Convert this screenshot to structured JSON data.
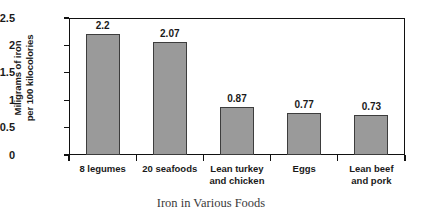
{
  "chart_data": {
    "type": "bar",
    "title": "",
    "xlabel": "Iron in Various Foods",
    "ylabel_line1": "Miligrams of iron",
    "ylabel_line2": "per 100 kilocolories",
    "categories": [
      "8 legumes",
      "20 seafoods",
      "Lean turkey and chicken",
      "Eggs",
      "Lean beef and pork"
    ],
    "category_lines": [
      [
        "8 legumes"
      ],
      [
        "20 seafoods"
      ],
      [
        "Lean turkey",
        "and chicken"
      ],
      [
        "Eggs"
      ],
      [
        "Lean beef",
        "and pork"
      ]
    ],
    "values": [
      2.2,
      2.07,
      0.87,
      0.77,
      0.73
    ],
    "value_labels": [
      "2.2",
      "2.07",
      "0.87",
      "0.77",
      "0.73"
    ],
    "ylim": [
      0,
      2.5
    ],
    "yticks": [
      0,
      0.5,
      1,
      1.5,
      2,
      2.5
    ],
    "ytick_labels": [
      "0",
      "0.5",
      "1",
      "1.5",
      "2",
      "2.5"
    ],
    "grid": false,
    "legend": "none",
    "bar_color": "#9a9a9a",
    "bar_edge_color": "#3d3d3d",
    "axis_color": "#111111"
  }
}
